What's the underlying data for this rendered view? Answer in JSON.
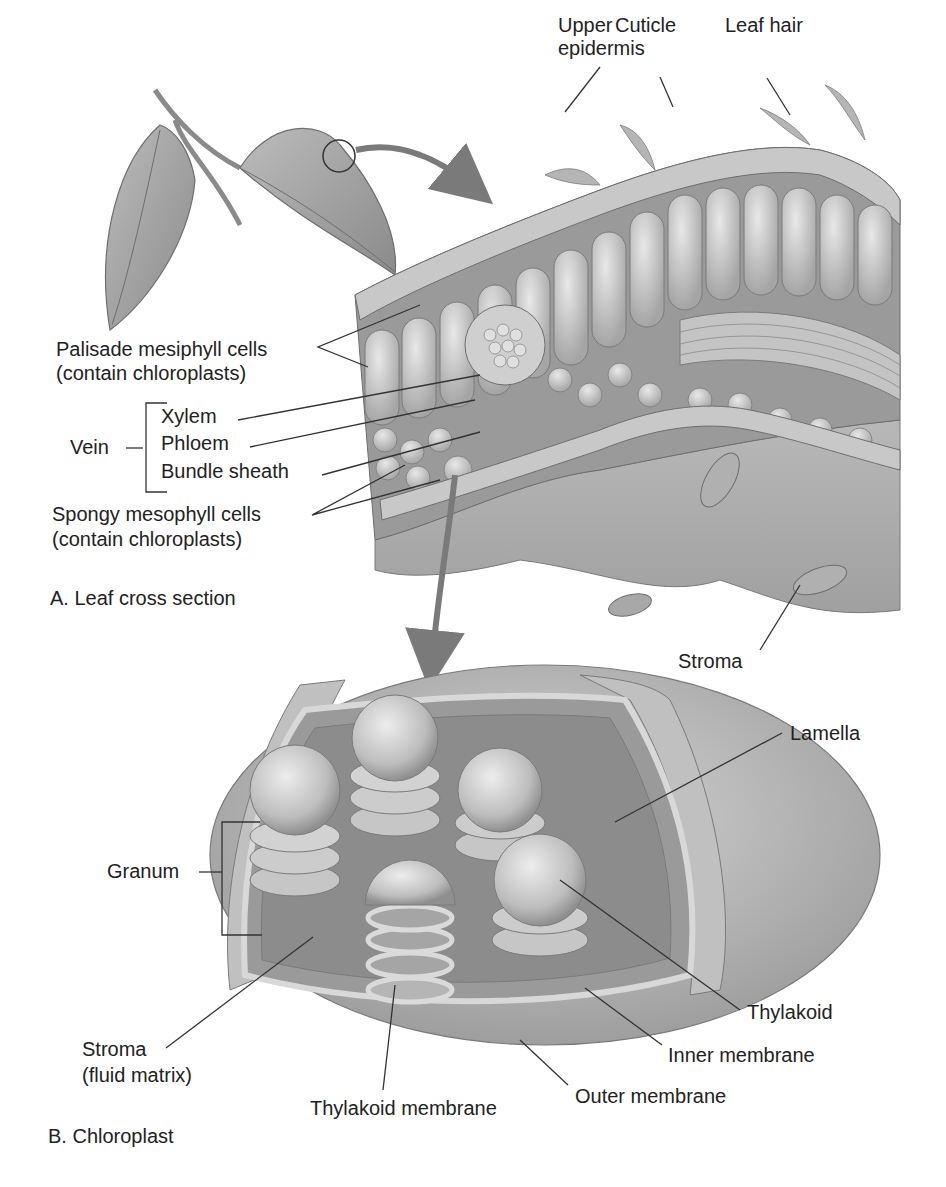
{
  "panel_a": {
    "caption": "A. Leaf cross section",
    "labels": {
      "upper_epidermis_1": "Upper",
      "upper_epidermis_2": "epidermis",
      "cuticle": "Cuticle",
      "leaf_hair": "Leaf hair",
      "palisade_1": "Palisade mesiphyll cells",
      "palisade_2": "(contain chloroplasts)",
      "vein": "Vein",
      "xylem": "Xylem",
      "phloem": "Phloem",
      "bundle_sheath": "Bundle sheath",
      "spongy_1": "Spongy mesophyll cells",
      "spongy_2": "(contain chloroplasts)",
      "stroma": "Stroma"
    }
  },
  "panel_b": {
    "caption": "B. Chloroplast",
    "labels": {
      "lamella": "Lamella",
      "granum": "Granum",
      "thylakoid": "Thylakoid",
      "stroma_1": "Stroma",
      "stroma_2": "(fluid matrix)",
      "inner_membrane": "Inner membrane",
      "outer_membrane": "Outer membrane",
      "thylakoid_membrane": "Thylakoid membrane"
    }
  },
  "colors": {
    "tissue_light": "#d9d9d9",
    "tissue_mid": "#b3b3b3",
    "tissue_dark": "#8c8c8c",
    "arrow": "#7a7a7a",
    "text": "#222222"
  }
}
